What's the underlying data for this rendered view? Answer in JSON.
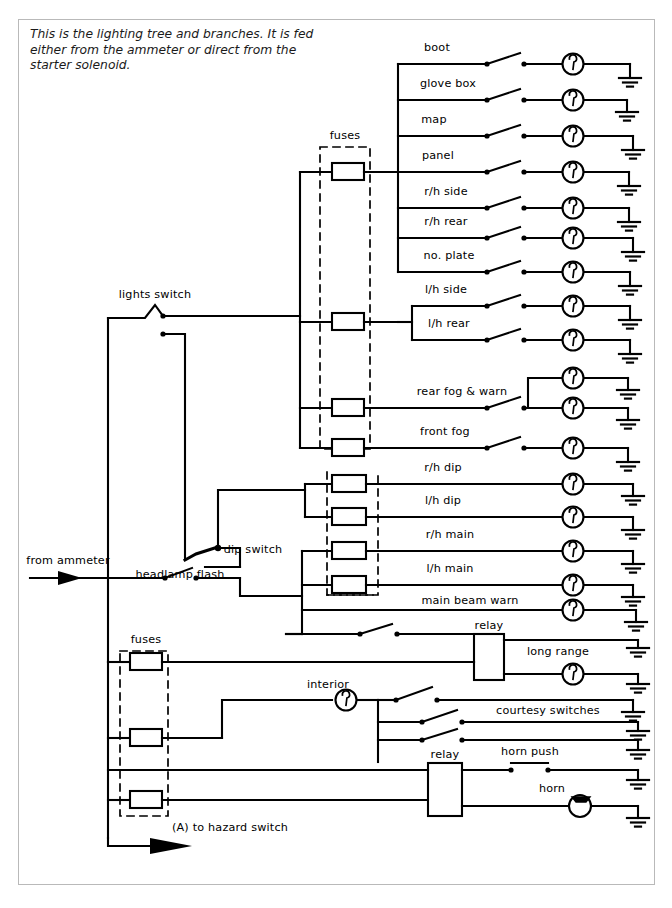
{
  "document": {
    "type": "automotive-wiring-diagram",
    "caption": "This is the lighting tree and branches. It is fed either from the ammeter or direct from the starter solenoid.",
    "border_color": "#b9b9b9",
    "line_color": "#000000",
    "background": "#ffffff"
  },
  "inputs": {
    "source_label": "from ammeter",
    "hazard_label": "(A) to hazard switch"
  },
  "switches": {
    "lights": "lights switch",
    "dip": "dip switch",
    "flash": "headlamp flash",
    "horn_push": "horn push",
    "courtesy": "courtesy switches"
  },
  "fuse_boxes": [
    {
      "name": "upper-fuses",
      "label": "fuses",
      "fuse_count": 4
    },
    {
      "name": "headlamp-fuses",
      "label": "",
      "fuse_count": 4
    },
    {
      "name": "lower-fuses",
      "label": "fuses",
      "fuse_count": 3
    }
  ],
  "relays": [
    {
      "name": "long-range-relay",
      "label": "relay"
    },
    {
      "name": "horn-relay",
      "label": "relay"
    }
  ],
  "circuits": [
    {
      "id": "boot",
      "label": "boot",
      "switched": true,
      "lamps": 1,
      "y": 64
    },
    {
      "id": "glove-box",
      "label": "glove box",
      "switched": true,
      "lamps": 1,
      "y": 100
    },
    {
      "id": "map",
      "label": "map",
      "switched": true,
      "lamps": 1,
      "y": 136
    },
    {
      "id": "panel",
      "label": "panel",
      "switched": true,
      "lamps": 1,
      "y": 172
    },
    {
      "id": "rh-side",
      "label": "r/h side",
      "switched": true,
      "lamps": 1,
      "y": 208
    },
    {
      "id": "rh-rear",
      "label": "r/h rear",
      "switched": true,
      "lamps": 1,
      "y": 238
    },
    {
      "id": "no-plate",
      "label": "no. plate",
      "switched": true,
      "lamps": 1,
      "y": 272
    },
    {
      "id": "lh-side",
      "label": "l/h side",
      "switched": true,
      "lamps": 1,
      "y": 306
    },
    {
      "id": "lh-rear",
      "label": "l/h rear",
      "switched": true,
      "lamps": 1,
      "y": 340
    },
    {
      "id": "rear-fog",
      "label": "rear fog & warn",
      "switched": true,
      "lamps": 2,
      "y": 408
    },
    {
      "id": "front-fog",
      "label": "front fog",
      "switched": true,
      "lamps": 1,
      "y": 448
    },
    {
      "id": "rh-dip",
      "label": "r/h dip",
      "switched": false,
      "lamps": 1,
      "y": 484
    },
    {
      "id": "lh-dip",
      "label": "l/h dip",
      "switched": false,
      "lamps": 1,
      "y": 517
    },
    {
      "id": "rh-main",
      "label": "r/h main",
      "switched": false,
      "lamps": 1,
      "y": 551
    },
    {
      "id": "lh-main",
      "label": "l/h main",
      "switched": false,
      "lamps": 1,
      "y": 585
    },
    {
      "id": "main-beam-warn",
      "label": "main beam warn",
      "switched": false,
      "lamps": 1,
      "y": 610
    },
    {
      "id": "long-range",
      "label": "long range",
      "switched": true,
      "lamps": 1,
      "y": 662
    },
    {
      "id": "interior",
      "label": "interior",
      "switched": true,
      "lamps": 1,
      "y": 700
    },
    {
      "id": "horn",
      "label": "horn",
      "switched": true,
      "lamps": 0,
      "y": 798
    }
  ],
  "labels": {
    "boot": "boot",
    "glove_box": "glove box",
    "map": "map",
    "panel": "panel",
    "rh_side": "r/h side",
    "rh_rear": "r/h rear",
    "no_plate": "no. plate",
    "lh_side": "l/h side",
    "lh_rear": "l/h rear",
    "rear_fog": "rear fog & warn",
    "front_fog": "front fog",
    "rh_dip": "r/h dip",
    "lh_dip": "l/h dip",
    "rh_main": "r/h main",
    "lh_main": "l/h main",
    "main_beam_warn": "main beam warn",
    "long_range": "long range",
    "interior": "interior",
    "horn": "horn",
    "fuses_upper": "fuses",
    "fuses_lower": "fuses",
    "relay_1": "relay",
    "relay_2": "relay",
    "lights_switch": "lights switch",
    "dip_switch": "dip switch",
    "headlamp_flash": "headlamp flash",
    "horn_push": "horn push",
    "courtesy_switches": "courtesy switches",
    "from_ammeter": "from ammeter",
    "hazard": "(A) to hazard switch"
  }
}
